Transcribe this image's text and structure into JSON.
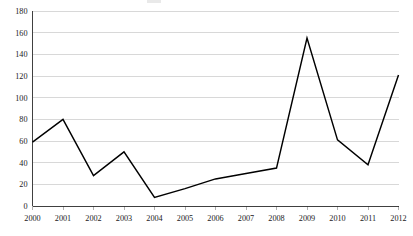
{
  "chart_data": {
    "type": "line",
    "title": "",
    "subtitle": "",
    "xlabel": "",
    "ylabel": "",
    "categories": [
      "2000",
      "2001",
      "2002",
      "2003",
      "2004",
      "2005",
      "2006",
      "2007",
      "2008",
      "2009",
      "2010",
      "2011",
      "2012"
    ],
    "x": [
      2000,
      2001,
      2002,
      2003,
      2004,
      2005,
      2006,
      2007,
      2008,
      2009,
      2010,
      2011,
      2012
    ],
    "values": [
      59,
      80,
      28,
      50,
      8,
      16,
      25,
      30,
      35,
      155,
      61,
      38,
      121
    ],
    "series": [
      {
        "name": "",
        "values": [
          59,
          80,
          28,
          50,
          8,
          16,
          25,
          30,
          35,
          155,
          61,
          38,
          121
        ]
      }
    ],
    "ylim": [
      0,
      180
    ],
    "xlim": [
      2000,
      2012
    ],
    "y_ticks": [
      0,
      20,
      40,
      60,
      80,
      100,
      120,
      140,
      160,
      180
    ],
    "y_tick_labels": [
      "0",
      "20",
      "40",
      "60",
      "80",
      "100",
      "120",
      "140",
      "160",
      "180"
    ],
    "x_tick_labels": [
      "2000",
      "2001",
      "2002",
      "2003",
      "2004",
      "2005",
      "2006",
      "2007",
      "2008",
      "2009",
      "2010",
      "2011",
      "2012"
    ],
    "grid": {
      "horizontal": true,
      "vertical": false,
      "color": "#c8c8c8"
    },
    "legend": {
      "visible": false,
      "position": "none",
      "entries": []
    },
    "annotations": [],
    "line_color": "#000000",
    "background_color": "#ffffff",
    "markers": false
  }
}
